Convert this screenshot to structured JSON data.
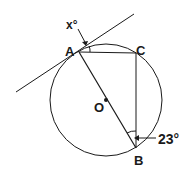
{
  "diagram": {
    "type": "circle-geometry",
    "labels": {
      "A": "A",
      "B": "B",
      "C": "C",
      "O": "O",
      "angle_x": "x°",
      "angle_23": "23°"
    },
    "angles": {
      "between_tangent_and_AC": "x°",
      "angle_ABC": "23°"
    },
    "colors": {
      "stroke": "#1a1a1a",
      "background": "#ffffff"
    }
  }
}
